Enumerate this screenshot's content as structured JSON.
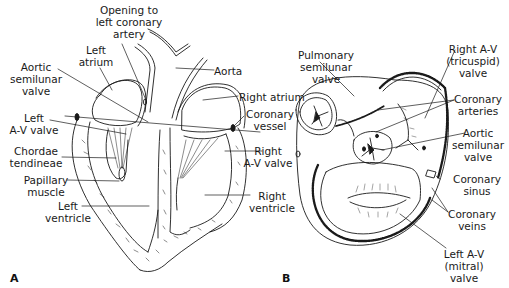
{
  "figure": {
    "panels": [
      {
        "id": "A",
        "label": "A",
        "view": "Longitudinal section of the heart",
        "labels": [
          {
            "key": "opening",
            "lines": [
              "Opening to",
              "left coronary",
              "artery"
            ]
          },
          {
            "key": "left_atrium",
            "lines": [
              "Left",
              "atrium"
            ]
          },
          {
            "key": "aortic_valve",
            "lines": [
              "Aortic",
              "semilunar",
              "valve"
            ]
          },
          {
            "key": "aorta",
            "lines": [
              "Aorta"
            ]
          },
          {
            "key": "right_atrium",
            "lines": [
              "Right atrium"
            ]
          },
          {
            "key": "left_av",
            "lines": [
              "Left",
              "A-V valve"
            ]
          },
          {
            "key": "coronary_vessel",
            "lines": [
              "Coronary",
              "vessel"
            ]
          },
          {
            "key": "chordae",
            "lines": [
              "Chordae",
              "tendineae"
            ]
          },
          {
            "key": "right_av",
            "lines": [
              "Right",
              "A-V valve"
            ]
          },
          {
            "key": "papillary",
            "lines": [
              "Papillary",
              "muscle"
            ]
          },
          {
            "key": "left_ventricle",
            "lines": [
              "Left",
              "ventricle"
            ]
          },
          {
            "key": "right_ventricle",
            "lines": [
              "Right",
              "ventricle"
            ]
          }
        ]
      },
      {
        "id": "B",
        "label": "B",
        "view": "Superior view of heart valves (atria removed)",
        "labels": [
          {
            "key": "pulmonary",
            "lines": [
              "Pulmonary",
              "semilunar",
              "valve"
            ]
          },
          {
            "key": "tricuspid",
            "lines": [
              "Right A-V",
              "(tricuspid)",
              "valve"
            ]
          },
          {
            "key": "coronary_arteries",
            "lines": [
              "Coronary",
              "arteries"
            ]
          },
          {
            "key": "aortic_b",
            "lines": [
              "Aortic",
              "semilunar",
              "valve"
            ]
          },
          {
            "key": "coronary_sinus",
            "lines": [
              "Coronary",
              "sinus"
            ]
          },
          {
            "key": "coronary_veins",
            "lines": [
              "Coronary",
              "veins"
            ]
          },
          {
            "key": "mitral",
            "lines": [
              "Left A-V",
              "(mitral)",
              "valve"
            ]
          }
        ]
      }
    ]
  },
  "text": {
    "a": {
      "opening": "Opening to\nleft coronary\nartery",
      "left_atrium": "Left\natrium",
      "aortic_valve": "Aortic\nsemilunar\nvalve",
      "aorta": "Aorta",
      "right_atrium": "Right atrium",
      "left_av": "Left\nA-V valve",
      "coronary_vessel": "Coronary\nvessel",
      "chordae": "Chordae\ntendineae",
      "right_av": "Right\nA-V valve",
      "papillary": "Papillary\nmuscle",
      "left_ventricle": "Left\nventricle",
      "right_ventricle": "Right\nventricle",
      "panel": "A"
    },
    "b": {
      "pulmonary": "Pulmonary\nsemilunar\nvalve",
      "tricuspid": "Right A-V\n(tricuspid)\nvalve",
      "coronary_arteries": "Coronary\narteries",
      "aortic": "Aortic\nsemilunar\nvalve",
      "coronary_sinus": "Coronary\nsinus",
      "coronary_veins": "Coronary\nveins",
      "mitral": "Left A-V\n(mitral)\nvalve",
      "panel": "B"
    }
  },
  "colors": {
    "line": "#1a1a1a",
    "background": "#ffffff"
  }
}
